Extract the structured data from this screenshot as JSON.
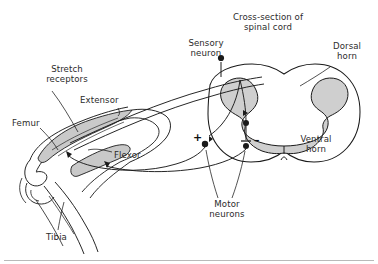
{
  "figure": {
    "title_caption": "",
    "domain": "anatomy-diagram",
    "background_color": "#ffffff",
    "ink_color": "#1a1a1a",
    "gray_matter_color": "#cfcfcf",
    "muscle_fill_color": "#c9c9c9"
  },
  "labels": {
    "cross_section": "Cross-section of\nspinal cord",
    "sensory_neuron": "Sensory\nneuron",
    "dorsal_horn": "Dorsal\nhorn",
    "ventral_horn": "Ventral\nhorn",
    "motor_neurons": "Motor\nneurons",
    "stretch_receptors": "Stretch\nreceptors",
    "extensor": "Extensor",
    "flexor": "Flexor",
    "femur": "Femur",
    "tibia": "Tibia"
  },
  "synapses": {
    "excitatory_sign": "+",
    "inhibitory_sign": "–"
  }
}
